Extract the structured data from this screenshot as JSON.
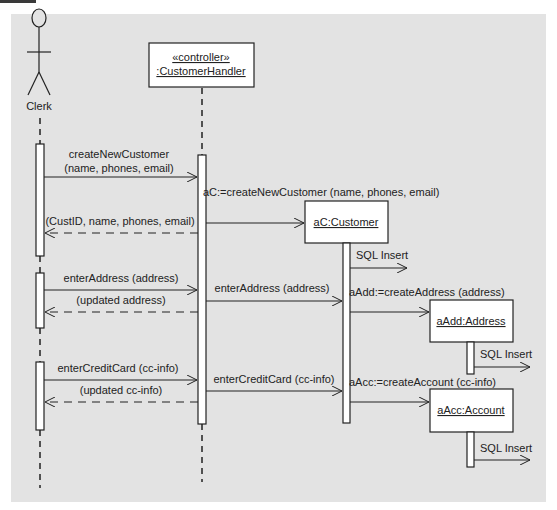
{
  "diagram": {
    "type": "UML sequence diagram",
    "colors": {
      "background": "#e3e3e3",
      "box_fill": "#ffffff",
      "line": "#222222"
    },
    "participants": [
      {
        "id": "clerk",
        "kind": "actor",
        "label": "Clerk"
      },
      {
        "id": "handler",
        "kind": "object",
        "stereotype": "«controller»",
        "label": ":CustomerHandler"
      },
      {
        "id": "customer",
        "kind": "object",
        "label": "aC:Customer"
      },
      {
        "id": "address",
        "kind": "object",
        "label": "aAdd:Address"
      },
      {
        "id": "account",
        "kind": "object",
        "label": "aAcc:Account"
      }
    ],
    "messages": [
      {
        "from": "clerk",
        "to": "handler",
        "kind": "sync",
        "line1": "createNewCustomer",
        "line2": "(name, phones, email)"
      },
      {
        "from": "handler",
        "to": "customer",
        "kind": "create",
        "label": "aC:=createNewCustomer (name, phones, email)"
      },
      {
        "from": "handler",
        "to": "clerk",
        "kind": "return",
        "label": "(CustID, name, phones, email)"
      },
      {
        "from": "customer",
        "to": "db",
        "kind": "async",
        "label": "SQL Insert"
      },
      {
        "from": "clerk",
        "to": "handler",
        "kind": "sync",
        "label": "enterAddress (address)"
      },
      {
        "from": "handler",
        "to": "clerk",
        "kind": "return",
        "label": "(updated address)"
      },
      {
        "from": "handler",
        "to": "customer",
        "kind": "sync",
        "label": "enterAddress (address)"
      },
      {
        "from": "customer",
        "to": "address",
        "kind": "create",
        "label": "aAdd:=createAddress (address)"
      },
      {
        "from": "address",
        "to": "db",
        "kind": "async",
        "label": "SQL Insert"
      },
      {
        "from": "clerk",
        "to": "handler",
        "kind": "sync",
        "label": "enterCreditCard (cc-info)"
      },
      {
        "from": "handler",
        "to": "clerk",
        "kind": "return",
        "label": "(updated cc-info)"
      },
      {
        "from": "handler",
        "to": "customer",
        "kind": "sync",
        "label": "enterCreditCard (cc-info)"
      },
      {
        "from": "customer",
        "to": "account",
        "kind": "create",
        "label": "aAcc:=createAccount (cc-info)"
      },
      {
        "from": "account",
        "to": "db",
        "kind": "async",
        "label": "SQL Insert"
      }
    ]
  }
}
